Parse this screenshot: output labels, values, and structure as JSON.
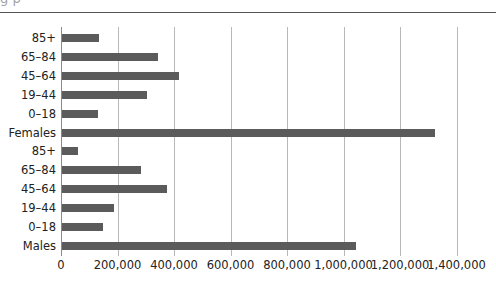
{
  "header": {
    "cropped_text": "g  p"
  },
  "chart_data": {
    "type": "bar",
    "orientation": "horizontal",
    "title": "",
    "xlabel": "",
    "ylabel": "",
    "categories": [
      "85+",
      "65–84",
      "45–64",
      "19–44",
      "0–18",
      "Females",
      "85+",
      "65–84",
      "45–64",
      "19–44",
      "0–18",
      "Males"
    ],
    "values": [
      130000,
      341000,
      415000,
      301000,
      126000,
      1321000,
      55000,
      281000,
      370000,
      183000,
      144000,
      1042000
    ],
    "groups": [
      {
        "name": "Females",
        "total": 1321000,
        "age_bands": {
          "0–18": 126000,
          "19–44": 301000,
          "45–64": 415000,
          "65–84": 341000,
          "85+": 130000
        }
      },
      {
        "name": "Males",
        "total": 1042000,
        "age_bands": {
          "0–18": 144000,
          "19–44": 183000,
          "45–64": 370000,
          "65–84": 281000,
          "85+": 55000
        }
      }
    ],
    "xticks": [
      "0",
      "200,000",
      "400,000",
      "600,000",
      "800,000",
      "1,000,000",
      "1,200,000",
      "1,400,000"
    ],
    "xlim": [
      0,
      1400000
    ],
    "grid": true,
    "legend": null,
    "bar_color": "#5b5b5b",
    "grid_color": "#b8b8b8"
  }
}
